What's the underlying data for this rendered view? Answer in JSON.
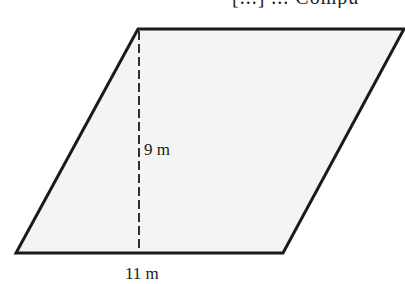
{
  "header": {
    "clipped_text": "[...] ... Compu"
  },
  "figure": {
    "shape": "parallelogram",
    "fill_color": "#f4f4f4",
    "stroke_color": "#1a1a1a",
    "vertices": {
      "top_left": [
        138,
        29
      ],
      "top_right": [
        404,
        29
      ],
      "bottom_right": [
        283,
        253
      ],
      "bottom_left": [
        16,
        253
      ]
    },
    "height_line": {
      "style": "dashed",
      "x": 139,
      "y_start": 29,
      "y_end": 253
    }
  },
  "labels": {
    "height": "9 m",
    "base": "11 m"
  }
}
